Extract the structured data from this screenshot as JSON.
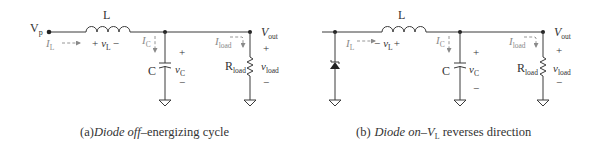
{
  "panels": [
    {
      "id": "a",
      "caption_prefix": "(a)",
      "caption_italic": "Diode off",
      "caption_rest": "–energizing cycle",
      "source_label": "V",
      "source_sub": "p",
      "inductor_label": "L",
      "vL_plus": "+",
      "vL_main": "v",
      "vL_sub": "L",
      "vL_minus": "−",
      "iL_main": "I",
      "iL_sub": "L",
      "iC_main": "I",
      "iC_sub": "C",
      "cap_label": "C",
      "vC_plus": "+",
      "vC_main": "v",
      "vC_sub": "C",
      "vC_minus": "−",
      "iload_main": "I",
      "iload_sub": "load",
      "vout_main": "V",
      "vout_sub": "out",
      "R_main": "R",
      "R_sub": "load",
      "vload_plus": "+",
      "vload_main": "v",
      "vload_sub": "load",
      "vload_minus": "−"
    },
    {
      "id": "b",
      "caption_prefix": "(b)",
      "caption_italic": "Diode on",
      "caption_dash": "–",
      "caption_v": "V",
      "caption_vsub": "L",
      "caption_rest": " reverses direction",
      "inductor_label": "L",
      "vL_plus": "+",
      "vL_main": "v",
      "vL_sub": "L",
      "vL_minus": "−",
      "iL_main": "I",
      "iL_sub": "L",
      "iC_main": "I",
      "iC_sub": "C",
      "cap_label": "C",
      "vC_plus": "+",
      "vC_main": "v",
      "vC_sub": "C",
      "vC_minus": "−",
      "iload_main": "I",
      "iload_sub": "load",
      "vout_main": "V",
      "vout_sub": "out",
      "R_main": "R",
      "R_sub": "load",
      "vload_plus": "+",
      "vload_main": "v",
      "vload_sub": "load",
      "vload_minus": "−"
    }
  ],
  "colors": {
    "wire": "#3a3a3a",
    "current_arrow": "#8a8a8a",
    "text": "#333333"
  }
}
